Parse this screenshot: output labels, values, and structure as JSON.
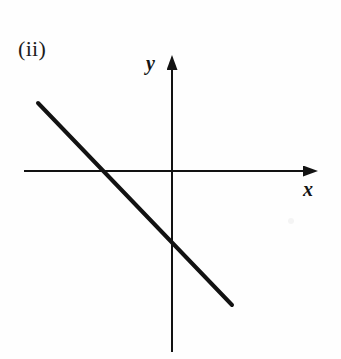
{
  "figure": {
    "part_label": "(ii)",
    "background_color": "#fefefe",
    "ink_color": "#121212",
    "width": 341,
    "height": 359
  },
  "axes": {
    "x_label": "x",
    "y_label": "y",
    "origin": {
      "x": 172,
      "y": 171
    },
    "x_axis": {
      "x1": 24,
      "y1": 171,
      "x2": 318,
      "y2": 171,
      "arrow": "right",
      "stroke_width": 2
    },
    "y_axis": {
      "x1": 172,
      "y1": 352,
      "x2": 172,
      "y2": 55,
      "arrow": "up",
      "stroke_width": 2
    },
    "arrowhead": {
      "width": 11,
      "length": 15
    }
  },
  "chart_data": {
    "type": "line",
    "title": "(ii)",
    "xlabel": "x",
    "ylabel": "y",
    "grid": false,
    "legend": null,
    "axis_style": "arrowed-cartesian-axes",
    "origin_px": {
      "x": 172,
      "y": 171
    },
    "series": [
      {
        "name": "straight line",
        "description": "Straight line with negative gradient and negative y-intercept",
        "stroke_color": "#121212",
        "stroke_width": 4,
        "points_px": [
          {
            "x": 38,
            "y": 103
          },
          {
            "x": 232,
            "y": 305
          }
        ],
        "x_intercept_px": {
          "x": 103,
          "y": 171
        },
        "y_intercept_px": {
          "x": 172,
          "y": 240
        },
        "gradient_px": -1.04,
        "gradient_sign": "negative",
        "y_intercept_sign": "negative",
        "x_intercept_sign": "negative"
      }
    ],
    "annotations": []
  },
  "artifacts": {
    "scan_speck": {
      "x": 288,
      "y": 218,
      "color": "#f4f4f4"
    }
  }
}
